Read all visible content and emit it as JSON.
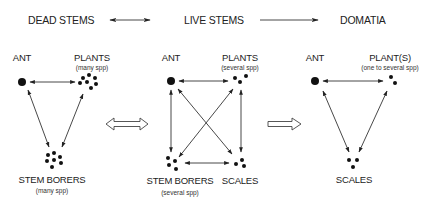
{
  "header": {
    "stages": [
      {
        "label": "DEAD STEMS"
      },
      {
        "label": "LIVE STEMS"
      },
      {
        "label": "DOMATIA"
      }
    ],
    "transitions": [
      {
        "from": "DEAD STEMS",
        "to": "LIVE STEMS",
        "type": "double-headed"
      },
      {
        "from": "LIVE STEMS",
        "to": "DOMATIA",
        "type": "single-headed"
      }
    ]
  },
  "panels": [
    {
      "name": "dead-stems",
      "nodes": {
        "ant": {
          "label": "ANT"
        },
        "plants": {
          "label": "PLANTS",
          "sub": "(many spp)"
        },
        "borers": {
          "label": "STEM BORERS",
          "sub": "(many spp)"
        }
      },
      "edges": [
        "ANT <-> PLANTS",
        "ANT -> STEM BORERS",
        "PLANTS -> STEM BORERS"
      ]
    },
    {
      "name": "live-stems",
      "nodes": {
        "ant": {
          "label": "ANT"
        },
        "plants": {
          "label": "PLANTS",
          "sub": "(several spp)"
        },
        "borers": {
          "label": "STEM BORERS",
          "sub": "(several spp)"
        },
        "scales": {
          "label": "SCALES"
        }
      },
      "edges": [
        "ANT <-> PLANTS",
        "ANT <-> STEM BORERS",
        "ANT <-> SCALES",
        "PLANTS <-> STEM BORERS",
        "PLANTS <-> SCALES",
        "STEM BORERS <-> SCALES"
      ]
    },
    {
      "name": "domatia",
      "nodes": {
        "ant": {
          "label": "ANT"
        },
        "plants": {
          "label": "PLANT(S)",
          "sub": "(one to several spp)"
        },
        "scales": {
          "label": "SCALES"
        }
      },
      "edges": [
        "ANT <-> PLANT(S)",
        "ANT -> SCALES",
        "PLANT(S) -> SCALES"
      ]
    }
  ],
  "between_panels": [
    {
      "type": "hollow-double-arrow"
    },
    {
      "type": "hollow-right-arrow"
    }
  ]
}
